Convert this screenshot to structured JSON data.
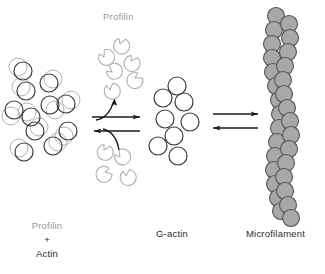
{
  "figure": {
    "width": 325,
    "height": 274,
    "background": "#ffffff"
  },
  "labels": {
    "profilin_top": "Profilin",
    "g_actin": "G-actin",
    "microfilament": "Microfilament",
    "profilin_actin_line1": "Profilin",
    "profilin_actin_plus": "+",
    "profilin_actin_line2": "Actin"
  },
  "colors": {
    "actin_outline": "#3a3a3a",
    "profilin_outline": "#b0b0b0",
    "filament_fill": "#a8a8a8",
    "filament_outline": "#555555",
    "arrow": "#1a1a1a",
    "label_gray": "#9a9a9a",
    "label_dark": "#2b2b2b"
  },
  "chart_data": {
    "type": "diagram",
    "stages": [
      {
        "name": "profilin-actin complex",
        "label": "Profilin + Actin",
        "element_count": 11,
        "description": "Cluster of overlapping dark actin circles paired with light gray profilin circles"
      },
      {
        "name": "free profilin",
        "label": "Profilin",
        "element_count": 11,
        "description": "Crescent / notched shapes released above and below the reversible arrow pair"
      },
      {
        "name": "g-actin monomers",
        "label": "G-actin",
        "element_count": 9,
        "description": "Cluster of plain dark outlined circles"
      },
      {
        "name": "microfilament",
        "label": "Microfilament",
        "element_count": 30,
        "description": "Double-helical chain of gray filled circles running vertically"
      }
    ],
    "arrows": [
      {
        "id": "left-forward",
        "direction": "right",
        "curved_branch": "up",
        "reversible_pair": true
      },
      {
        "id": "left-reverse",
        "direction": "left",
        "curved_branch": "down",
        "reversible_pair": true
      },
      {
        "id": "right-forward",
        "direction": "right",
        "curved_branch": "none",
        "reversible_pair": true
      },
      {
        "id": "right-reverse",
        "direction": "left",
        "curved_branch": "none",
        "reversible_pair": true
      }
    ],
    "profilin_actin_cluster": [
      {
        "ax": 23,
        "ay": 71,
        "px": 18,
        "py": 67
      },
      {
        "ax": 26,
        "ay": 91,
        "px": 21,
        "py": 87
      },
      {
        "ax": 14,
        "ay": 110,
        "px": 11,
        "py": 116
      },
      {
        "ax": 31,
        "ay": 117,
        "px": 27,
        "py": 112
      },
      {
        "ax": 35,
        "ay": 131,
        "px": 39,
        "py": 127
      },
      {
        "ax": 24,
        "ay": 152,
        "px": 19,
        "py": 148
      },
      {
        "ax": 49,
        "ay": 83,
        "px": 53,
        "py": 79
      },
      {
        "ax": 50,
        "ay": 105,
        "px": 55,
        "py": 110
      },
      {
        "ax": 66,
        "ay": 104,
        "px": 71,
        "py": 100
      },
      {
        "ax": 53,
        "ay": 146,
        "px": 58,
        "py": 142
      },
      {
        "ax": 68,
        "ay": 131,
        "px": 64,
        "py": 136
      }
    ],
    "profilin_free_top": [
      {
        "x": 120,
        "y": 44
      },
      {
        "x": 104,
        "y": 57
      },
      {
        "x": 131,
        "y": 61
      },
      {
        "x": 112,
        "y": 72
      },
      {
        "x": 135,
        "y": 78
      },
      {
        "x": 110,
        "y": 90
      }
    ],
    "profilin_free_bottom": [
      {
        "x": 104,
        "y": 150
      },
      {
        "x": 120,
        "y": 157
      },
      {
        "x": 105,
        "y": 172
      },
      {
        "x": 126,
        "y": 176
      }
    ],
    "g_actin_cluster": [
      {
        "x": 177,
        "y": 86
      },
      {
        "x": 163,
        "y": 98
      },
      {
        "x": 184,
        "y": 102
      },
      {
        "x": 165,
        "y": 119
      },
      {
        "x": 190,
        "y": 122
      },
      {
        "x": 174,
        "y": 136
      },
      {
        "x": 158,
        "y": 146
      },
      {
        "x": 178,
        "y": 156
      }
    ]
  }
}
